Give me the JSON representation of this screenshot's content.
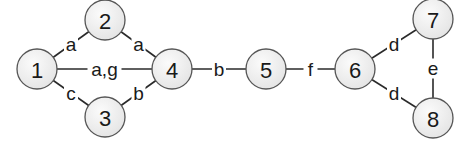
{
  "diagram": {
    "type": "graph",
    "colors": {
      "node_fill": "#efefef",
      "node_stroke": "#555555",
      "edge": "#2a2a2a",
      "text": "#1a1a1a",
      "background": "#ffffff"
    },
    "nodes": [
      {
        "id": "1",
        "label": "1",
        "x": 37,
        "y": 69
      },
      {
        "id": "2",
        "label": "2",
        "x": 105,
        "y": 20
      },
      {
        "id": "3",
        "label": "3",
        "x": 105,
        "y": 117
      },
      {
        "id": "4",
        "label": "4",
        "x": 172,
        "y": 69
      },
      {
        "id": "5",
        "label": "5",
        "x": 266,
        "y": 69
      },
      {
        "id": "6",
        "label": "6",
        "x": 355,
        "y": 69
      },
      {
        "id": "7",
        "label": "7",
        "x": 433,
        "y": 19
      },
      {
        "id": "8",
        "label": "8",
        "x": 433,
        "y": 118
      }
    ],
    "edges": [
      {
        "from": "1",
        "to": "2",
        "label": "a"
      },
      {
        "from": "2",
        "to": "4",
        "label": "a"
      },
      {
        "from": "1",
        "to": "4",
        "label": "a,g"
      },
      {
        "from": "1",
        "to": "3",
        "label": "c"
      },
      {
        "from": "3",
        "to": "4",
        "label": "b"
      },
      {
        "from": "4",
        "to": "5",
        "label": "b"
      },
      {
        "from": "5",
        "to": "6",
        "label": "f"
      },
      {
        "from": "6",
        "to": "7",
        "label": "d"
      },
      {
        "from": "6",
        "to": "8",
        "label": "d"
      },
      {
        "from": "7",
        "to": "8",
        "label": "e"
      }
    ]
  }
}
